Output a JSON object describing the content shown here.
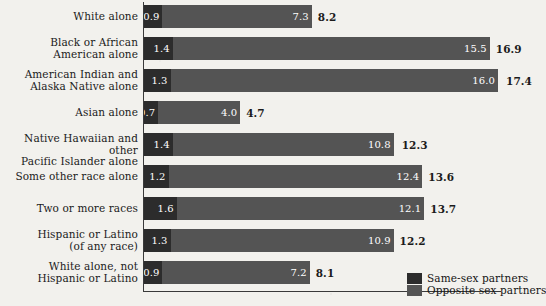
{
  "chart_data": {
    "type": "bar",
    "title": "",
    "subtitle": "",
    "xlabel": "",
    "ylabel": "",
    "orientation": "horizontal",
    "stacked": true,
    "grid": false,
    "legend_position": "bottom-right",
    "xlim": [
      0,
      17.4
    ],
    "categories": [
      "White alone",
      "Black or African American alone",
      "American Indian and Alaska Native alone",
      "Asian alone",
      "Native Hawaiian and other Pacific Islander alone",
      "Some other race alone",
      "Two or more races",
      "Hispanic or Latino (of any race)",
      "White alone, not Hispanic or Latino"
    ],
    "series": [
      {
        "name": "Same-sex partners",
        "color": "#2c2c2c",
        "values": [
          0.9,
          1.4,
          1.3,
          0.7,
          1.4,
          1.2,
          1.6,
          1.3,
          0.9
        ]
      },
      {
        "name": "Opposite sex partners",
        "color": "#545454",
        "values": [
          7.3,
          15.5,
          16.0,
          4.0,
          10.8,
          12.4,
          12.1,
          10.9,
          7.2
        ]
      }
    ],
    "totals": [
      8.2,
      16.9,
      17.4,
      4.7,
      12.3,
      13.6,
      13.7,
      12.2,
      8.1
    ]
  },
  "rows": [
    {
      "label_line1": "White alone",
      "label_line2": "",
      "same": "0.9",
      "opposite": "7.3",
      "total": "8.2"
    },
    {
      "label_line1": "Black or African",
      "label_line2": "American alone",
      "same": "1.4",
      "opposite": "15.5",
      "total": "16.9"
    },
    {
      "label_line1": "American Indian and",
      "label_line2": "Alaska Native alone",
      "same": "1.3",
      "opposite": "16.0",
      "total": "17.4"
    },
    {
      "label_line1": "Asian alone",
      "label_line2": "",
      "same": "0.7",
      "opposite": "4.0",
      "total": "4.7"
    },
    {
      "label_line1": "Native Hawaiian and other",
      "label_line2": "Pacific Islander alone",
      "same": "1.4",
      "opposite": "10.8",
      "total": "12.3"
    },
    {
      "label_line1": "Some other race alone",
      "label_line2": "",
      "same": "1.2",
      "opposite": "12.4",
      "total": "13.6"
    },
    {
      "label_line1": "Two or more races",
      "label_line2": "",
      "same": "1.6",
      "opposite": "12.1",
      "total": "13.7"
    },
    {
      "label_line1": "Hispanic or Latino",
      "label_line2": "(of any race)",
      "same": "1.3",
      "opposite": "10.9",
      "total": "12.2"
    },
    {
      "label_line1": "White alone, not",
      "label_line2": "Hispanic or Latino",
      "same": "0.9",
      "opposite": "7.2",
      "total": "8.1"
    }
  ],
  "legend": {
    "same_label": "Same-sex partners",
    "opposite_label": "Opposite sex partners",
    "same_color": "#2c2c2c",
    "opposite_color": "#545454"
  },
  "geometry": {
    "bar_origin_x": 144,
    "px_per_unit": 20.46,
    "row_pitch": 32,
    "first_row_top": 0,
    "bar_height": 23
  }
}
